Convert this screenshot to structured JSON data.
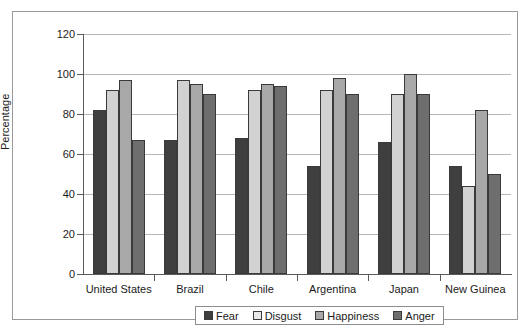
{
  "chart_data": {
    "type": "bar",
    "title": "",
    "subtitle": "",
    "xlabel": "",
    "ylabel": "Percentage",
    "ylim": [
      0,
      120
    ],
    "ytick_step": 20,
    "yticks": [
      0,
      20,
      40,
      60,
      80,
      100,
      120
    ],
    "ytick_labels": [
      "0",
      "20",
      "40",
      "60",
      "80",
      "100",
      "120"
    ],
    "grid": true,
    "grid_axis": "y",
    "legend_position": "bottom",
    "categories": [
      "United States",
      "Brazil",
      "Chile",
      "Argentina",
      "Japan",
      "New Guinea"
    ],
    "series": [
      {
        "name": "Fear",
        "color": "#3f3f3f",
        "values": [
          82,
          67,
          68,
          54,
          66,
          54
        ]
      },
      {
        "name": "Disgust",
        "color": "#d2d2d2",
        "values": [
          92,
          97,
          92,
          92,
          90,
          44
        ]
      },
      {
        "name": "Happiness",
        "color": "#a8a8a8",
        "values": [
          97,
          95,
          95,
          98,
          100,
          82
        ]
      },
      {
        "name": "Anger",
        "color": "#6e6e6e",
        "values": [
          67,
          90,
          94,
          90,
          90,
          50
        ]
      }
    ]
  },
  "legend": {
    "items": [
      {
        "label": "Fear"
      },
      {
        "label": "Disgust"
      },
      {
        "label": "Happiness"
      },
      {
        "label": "Anger"
      }
    ]
  },
  "colors": {
    "series_fear": "#3f3f3f",
    "series_disgust": "#d2d2d2",
    "series_happiness": "#a8a8a8",
    "series_anger": "#6e6e6e",
    "gridline": "#b6b6b6",
    "axis": "#5a5a5a",
    "frame": "#9a9a9a",
    "text": "#1b1b1b",
    "background": "#ffffff"
  }
}
